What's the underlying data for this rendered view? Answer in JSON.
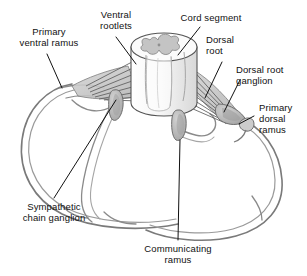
{
  "figure": {
    "type": "anatomical-diagram",
    "background": "#ffffff",
    "palette": {
      "outline": "#4a4a4a",
      "outline_dark": "#2b2b2b",
      "nerve_fill": "#cfcfcf",
      "ganglion_fill": "#b9b9b9",
      "cord_fill": "#f2f2f2",
      "gray_matter": "#c2c2c2",
      "leader_line": "#1a1a1a",
      "text": "#111111"
    }
  },
  "labels": [
    {
      "id": "primary-ventral-ramus",
      "line1": "Primary",
      "line2": "ventral ramus"
    },
    {
      "id": "ventral-rootlets",
      "line1": "Ventral",
      "line2": "rootlets"
    },
    {
      "id": "cord-segment",
      "line1": "Cord segment",
      "line2": ""
    },
    {
      "id": "dorsal-root",
      "line1": "Dorsal",
      "line2": "root"
    },
    {
      "id": "dorsal-root-ganglion",
      "line1": "Dorsal root",
      "line2": "ganglion"
    },
    {
      "id": "primary-dorsal-ramus",
      "line1": "Primary",
      "line2": "dorsal",
      "line3": "ramus"
    },
    {
      "id": "sympathetic-chain-ganglion",
      "line1": "Sympathetic",
      "line2": "chain ganglion"
    },
    {
      "id": "communicating-ramus",
      "line1": "Communicating",
      "line2": "ramus"
    }
  ]
}
